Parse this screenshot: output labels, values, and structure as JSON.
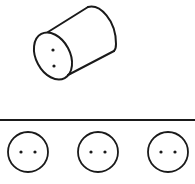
{
  "diagram": {
    "type": "spatial-reasoning-puzzle",
    "stroke_color": "#1a1a1a",
    "background": "#ffffff",
    "cylinder": {
      "description": "cylinder viewed at an angle with two dots on its end face"
    },
    "divider": {
      "description": "horizontal separator line"
    },
    "options": [
      {
        "description": "circle with two horizontal dots"
      },
      {
        "description": "circle with two horizontal dots"
      },
      {
        "description": "circle with two horizontal dots"
      }
    ]
  }
}
